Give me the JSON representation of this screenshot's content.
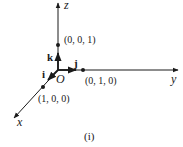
{
  "diagram": {
    "type": "3d-coordinate-axes",
    "caption": "(i)",
    "origin_label": "O",
    "axes": [
      {
        "name": "x",
        "label": "x"
      },
      {
        "name": "y",
        "label": "y"
      },
      {
        "name": "z",
        "label": "z"
      }
    ],
    "unit_vectors": [
      {
        "name": "i",
        "label": "i",
        "axis": "x"
      },
      {
        "name": "j",
        "label": "j",
        "axis": "y"
      },
      {
        "name": "k",
        "label": "k",
        "axis": "z"
      }
    ],
    "points": [
      {
        "name": "x-unit-point",
        "label": "(1, 0, 0)"
      },
      {
        "name": "y-unit-point",
        "label": "(0, 1, 0)"
      },
      {
        "name": "z-unit-point",
        "label": "(0, 0, 1)"
      }
    ],
    "colors": {
      "ink": "#1a1a1a",
      "background": "#ffffff"
    }
  }
}
